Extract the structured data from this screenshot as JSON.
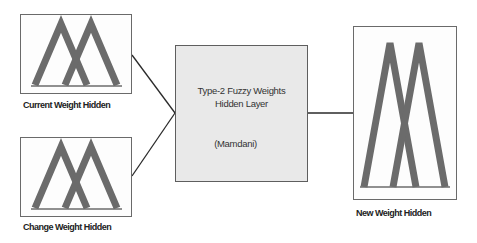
{
  "diagram": {
    "inputs": [
      {
        "id": "current",
        "label": "Current Weight Hidden"
      },
      {
        "id": "change",
        "label": "Change Weight Hidden"
      }
    ],
    "processor": {
      "title_line1": "Type-2 Fuzzy Weights",
      "title_line2": "Hidden Layer",
      "subtitle": "(Mamdani)"
    },
    "output": {
      "id": "new",
      "label": "New Weight Hidden"
    },
    "colors": {
      "membership_fill": "#6b6b6b",
      "box_border": "#6a6a6a",
      "processor_fill": "#e9e9e9",
      "connector": "#2a2a2a"
    }
  }
}
